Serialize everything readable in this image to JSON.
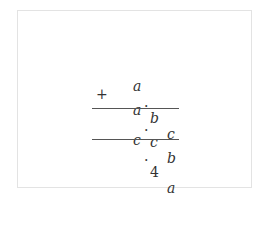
{
  "diagram": {
    "type": "vertical-addition",
    "operator": "+",
    "rows": [
      {
        "id": "addend1",
        "d1": "a",
        "sep": ".",
        "d2": "b",
        "d3": "c"
      },
      {
        "id": "addend2",
        "d1": "a",
        "sep": ".",
        "d2": "c",
        "d3": "b"
      },
      {
        "id": "sum",
        "d1": "c",
        "sep": ".",
        "d2": "4",
        "d3": "a"
      }
    ],
    "lines": [
      "above-sum",
      "below-sum"
    ],
    "colors": {
      "text": "#333333",
      "rule": "#555555",
      "frame": "#e3e3e3"
    }
  }
}
